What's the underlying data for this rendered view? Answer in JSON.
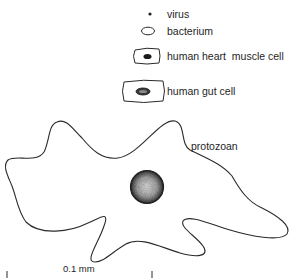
{
  "diagram": {
    "legend": [
      {
        "id": "virus",
        "label": "virus"
      },
      {
        "id": "bacterium",
        "label": "bacterium"
      },
      {
        "id": "heart",
        "label": "human heart  muscle cell"
      },
      {
        "id": "gut",
        "label": "human gut cell"
      }
    ],
    "protozoan_label": "protozoan",
    "scale_bar": {
      "label": "0.1 mm"
    },
    "colors": {
      "line": "#2a2a2a",
      "background": "#ffffff"
    }
  }
}
